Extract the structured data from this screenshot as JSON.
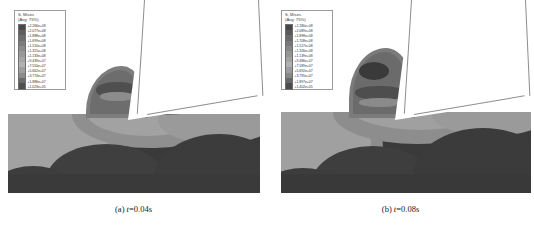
{
  "figure": {
    "type": "fea-contour-pair"
  },
  "panels": [
    {
      "id": "panel-a",
      "caption_prefix": "(a)",
      "caption_var": "t",
      "caption_value": "=0.04s",
      "caption_full": "(a) t=0.04s",
      "legend": {
        "title": "S, Mises",
        "subtitle": "(Avg: 75%)",
        "labels": [
          "+2.266e+08",
          "+2.077e+08",
          "+1.888e+08",
          "+1.699e+08",
          "+1.510e+08",
          "+1.321e+08",
          "+1.133e+08",
          "+9.439e+07",
          "+7.550e+07",
          "+5.662e+07",
          "+3.774e+07",
          "+1.886e+07",
          "+1.023e+05"
        ],
        "swatch_colors": [
          "#4a4a4a",
          "#5e5e5e",
          "#6d6d6d",
          "#7c7c7c",
          "#8a8a8a",
          "#999999",
          "#a6a6a6",
          "#b2b2b2",
          "#9e9e9e",
          "#8b8b8b",
          "#6a6a6a",
          "#4f4f4f"
        ]
      }
    },
    {
      "id": "panel-b",
      "caption_prefix": "(b)",
      "caption_var": "t",
      "caption_value": "=0.08s",
      "caption_full": "(b) t=0.08s",
      "legend": {
        "title": "S, Mises",
        "subtitle": "(Avg: 75%)",
        "labels": [
          "+2.280e+08",
          "+2.089e+08",
          "+1.898e+08",
          "+1.708e+08",
          "+1.517e+08",
          "+1.326e+08",
          "+1.139e+08",
          "+9.486e+07",
          "+7.589e+07",
          "+5.692e+07",
          "+3.795e+07",
          "+1.897e+07",
          "+1.402e+05"
        ],
        "swatch_colors": [
          "#474747",
          "#5a5a5a",
          "#696969",
          "#787878",
          "#878787",
          "#959595",
          "#a3a3a3",
          "#b0b0b0",
          "#9c9c9c",
          "#888888",
          "#676767",
          "#4c4c4c"
        ]
      }
    }
  ],
  "colors": {
    "background": "#ffffff",
    "tool_fill": "#ffffff",
    "tool_outline": "#8e8e8e",
    "legend_border": "#9a9a9a",
    "text": "#1a1a1a"
  }
}
